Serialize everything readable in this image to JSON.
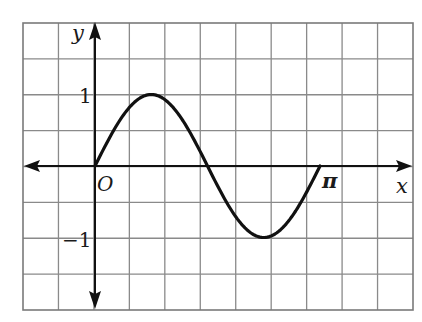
{
  "chart_data": {
    "type": "line",
    "title": "",
    "function": "y = sin(2x)",
    "xlabel": "x",
    "ylabel": "y",
    "origin_label": "O",
    "x_tick_labels": [
      {
        "value": 3.14159,
        "label": "π"
      }
    ],
    "y_tick_labels": [
      {
        "value": 1,
        "label": "1"
      },
      {
        "value": -1,
        "label": "−1"
      }
    ],
    "xlim": [
      -0.6,
      2.99
    ],
    "ylim": [
      -1.98,
      2.0
    ],
    "grid": true,
    "grid_columns": 11,
    "grid_rows": 8,
    "series": [
      {
        "name": "curve",
        "x": [
          0,
          0.3927,
          0.7854,
          1.1781,
          1.5708,
          1.9635,
          2.3562,
          2.7489,
          3.1416
        ],
        "y": [
          0,
          0.707,
          1,
          0.707,
          0,
          -0.707,
          -1,
          -0.707,
          0
        ]
      }
    ],
    "key_points": [
      {
        "x": 0,
        "y": 0,
        "note": "origin"
      },
      {
        "x": 0.7854,
        "y": 1,
        "note": "maximum"
      },
      {
        "x": 1.5708,
        "y": 0,
        "note": "zero crossing"
      },
      {
        "x": 2.3562,
        "y": -1,
        "note": "minimum"
      },
      {
        "x": 3.1416,
        "y": 0,
        "note": "end at π"
      }
    ]
  },
  "labels": {
    "y_axis": "y",
    "x_axis": "x",
    "origin": "O",
    "pi": "π",
    "one": "1",
    "minus_one": "−1"
  },
  "colors": {
    "grid": "#8a8a8a",
    "axis": "#111111",
    "curve": "#111111"
  }
}
